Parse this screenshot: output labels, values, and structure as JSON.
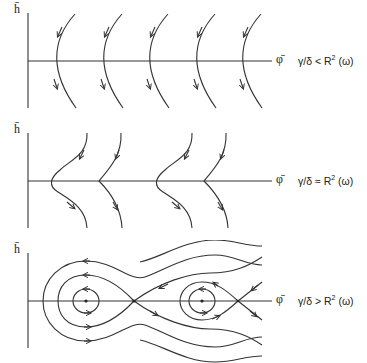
{
  "figure": {
    "panels": [
      {
        "id": "subcritical",
        "y_axis_label": "h̄",
        "x_axis_label": "φ̄",
        "condition_lhs": "γ/δ",
        "condition_relation": "<",
        "condition_rhs_base": "R",
        "condition_rhs_exp": "2",
        "condition_rhs_arg": "(ω)",
        "description": "Five identical arc trajectories flowing downward, bending left at the φ̄ axis"
      },
      {
        "id": "critical",
        "y_axis_label": "h̄",
        "x_axis_label": "φ̄",
        "condition_lhs": "γ/δ",
        "condition_relation": "≈",
        "condition_rhs_base": "R",
        "condition_rhs_exp": "2",
        "condition_rhs_arg": "(ω)",
        "description": "Four trajectories flowing downward; alternating smooth S-shapes and cusps at the φ̄ axis"
      },
      {
        "id": "supercritical",
        "y_axis_label": "h̄",
        "x_axis_label": "φ̄",
        "condition_lhs": "γ/δ",
        "condition_relation": ">",
        "condition_rhs_base": "R",
        "condition_rhs_exp": "2",
        "condition_rhs_arg": "(ω)",
        "description": "Phase portrait with two centers enclosed by closed orbits, separatrices crossing at saddle points, and outer running trajectories"
      }
    ],
    "fixed_points": {
      "centers": [
        "center-1",
        "center-2"
      ],
      "saddles": [
        "saddle-1",
        "saddle-2"
      ]
    }
  }
}
